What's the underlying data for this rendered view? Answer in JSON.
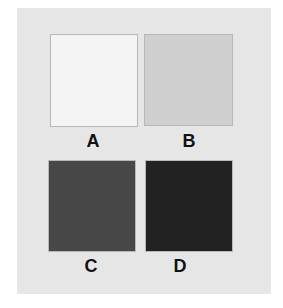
{
  "figure": {
    "swatches": [
      {
        "label": "A",
        "color": "#f4f4f4"
      },
      {
        "label": "B",
        "color": "#cfcfcf"
      },
      {
        "label": "C",
        "color": "#474747"
      },
      {
        "label": "D",
        "color": "#222222"
      }
    ],
    "panel_color": "#e6e6e6"
  }
}
